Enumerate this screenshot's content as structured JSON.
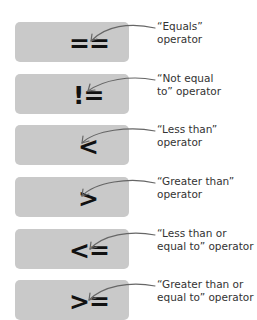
{
  "items": [
    {
      "operator": "==",
      "label_line1": "“Equals”",
      "label_line2": "operator"
    },
    {
      "operator": "!=",
      "label_line1": "“Not equal",
      "label_line2": "to” operator"
    },
    {
      "operator": "<",
      "label_line1": "“Less than”",
      "label_line2": "operator"
    },
    {
      "operator": ">",
      "label_line1": "“Greater than”",
      "label_line2": "operator"
    },
    {
      "operator": "<=",
      "label_line1": "“Less than or",
      "label_line2": "equal to” operator"
    },
    {
      "operator": ">=",
      "label_line1": "“Greater than or",
      "label_line2": "equal to” operator"
    }
  ],
  "colors": {
    "box": "#c9c9c9",
    "text": "#333333",
    "arrow": "#666666"
  }
}
